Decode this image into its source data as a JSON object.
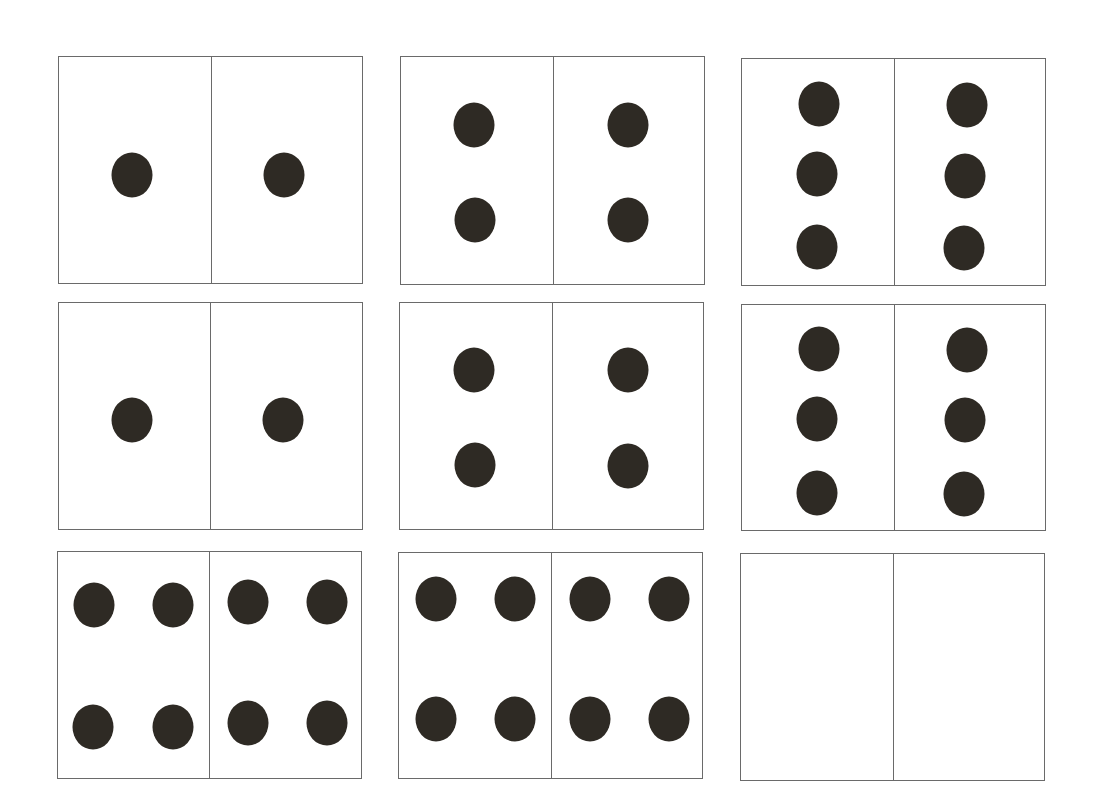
{
  "dot_color": "#2e2a24",
  "border_color": "#6a6a6a",
  "cards": [
    {
      "id": "1-1",
      "box": [
        58,
        56,
        363,
        284
      ],
      "div": 210,
      "left_dots": 1,
      "right_dots": 1,
      "dots": [
        [
          131,
          174
        ],
        [
          283,
          174
        ]
      ]
    },
    {
      "id": "2-2",
      "box": [
        400,
        56,
        705,
        285
      ],
      "div": 552,
      "left_dots": 2,
      "right_dots": 2,
      "dots": [
        [
          473,
          124
        ],
        [
          627,
          124
        ],
        [
          474,
          219
        ],
        [
          627,
          219
        ]
      ]
    },
    {
      "id": "3-3",
      "box": [
        741,
        58,
        1046,
        286
      ],
      "div": 893,
      "left_dots": 3,
      "right_dots": 3,
      "dots": [
        [
          818,
          103
        ],
        [
          966,
          104
        ],
        [
          816,
          173
        ],
        [
          964,
          175
        ],
        [
          816,
          246
        ],
        [
          963,
          247
        ]
      ]
    },
    {
      "id": "1-1b",
      "box": [
        58,
        302,
        363,
        530
      ],
      "div": 209,
      "left_dots": 1,
      "right_dots": 1,
      "dots": [
        [
          131,
          419
        ],
        [
          282,
          419
        ]
      ]
    },
    {
      "id": "2-2b",
      "box": [
        399,
        302,
        704,
        530
      ],
      "div": 551,
      "left_dots": 2,
      "right_dots": 2,
      "dots": [
        [
          473,
          369
        ],
        [
          627,
          369
        ],
        [
          474,
          464
        ],
        [
          627,
          465
        ]
      ]
    },
    {
      "id": "3-3b",
      "box": [
        741,
        304,
        1046,
        531
      ],
      "div": 893,
      "left_dots": 3,
      "right_dots": 3,
      "dots": [
        [
          818,
          348
        ],
        [
          966,
          349
        ],
        [
          816,
          418
        ],
        [
          964,
          419
        ],
        [
          816,
          492
        ],
        [
          963,
          493
        ]
      ]
    },
    {
      "id": "4-4",
      "box": [
        57,
        551,
        362,
        779
      ],
      "div": 208,
      "left_dots": 4,
      "right_dots": 4,
      "dots": [
        [
          93,
          604
        ],
        [
          172,
          604
        ],
        [
          247,
          601
        ],
        [
          326,
          601
        ],
        [
          92,
          726
        ],
        [
          172,
          726
        ],
        [
          247,
          722
        ],
        [
          326,
          722
        ]
      ]
    },
    {
      "id": "4-4b",
      "box": [
        398,
        552,
        703,
        779
      ],
      "div": 550,
      "left_dots": 4,
      "right_dots": 4,
      "dots": [
        [
          435,
          598
        ],
        [
          514,
          598
        ],
        [
          589,
          598
        ],
        [
          668,
          598
        ],
        [
          435,
          718
        ],
        [
          514,
          718
        ],
        [
          589,
          718
        ],
        [
          668,
          718
        ]
      ]
    },
    {
      "id": "blank",
      "box": [
        740,
        553,
        1045,
        781
      ],
      "div": 892,
      "left_dots": 0,
      "right_dots": 0,
      "dots": []
    }
  ]
}
